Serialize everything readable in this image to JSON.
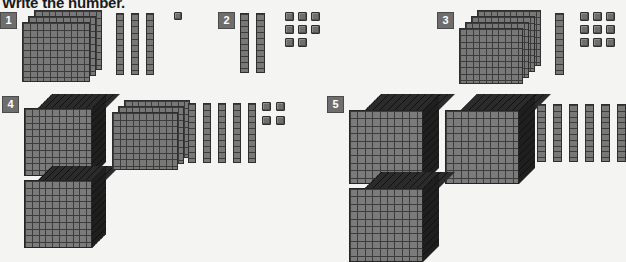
{
  "worksheet": {
    "title": "Write the number.",
    "background_color": "#f4f4f2",
    "block_color": "#787878",
    "badge_color": "#6e6e6e"
  },
  "problems": [
    {
      "number": "1",
      "cubes": 0,
      "flats": 3,
      "rods": 3,
      "units": 1,
      "answer": "331"
    },
    {
      "number": "2",
      "cubes": 0,
      "flats": 0,
      "rods": 2,
      "units": 8,
      "answer": "28"
    },
    {
      "number": "3",
      "cubes": 0,
      "flats": 4,
      "rods": 1,
      "units": 9,
      "answer": "419"
    },
    {
      "number": "4",
      "cubes": 2,
      "flats": 3,
      "rods": 5,
      "units": 4,
      "answer": "2354"
    },
    {
      "number": "5",
      "cubes": 3,
      "flats": 0,
      "rods": 6,
      "units": 0,
      "answer": "3060"
    }
  ]
}
